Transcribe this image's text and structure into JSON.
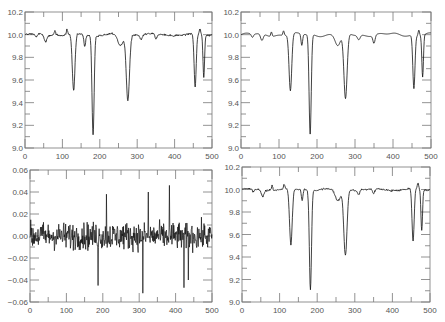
{
  "chart_data": [
    {
      "type": "line",
      "panel": "top-left",
      "title": "",
      "xlabel": "",
      "ylabel": "",
      "xlim": [
        0,
        500
      ],
      "ylim": [
        9.0,
        10.2
      ],
      "xticks": [
        "0",
        "100",
        "200",
        "300",
        "400",
        "500"
      ],
      "yticks": [
        "9.0",
        "9.2",
        "9.4",
        "9.6",
        "9.8",
        "10.0",
        "10.2"
      ],
      "style": "noisy",
      "baseline": 10.0,
      "dips": [
        {
          "x": 30,
          "depth": 0.03,
          "w": 4
        },
        {
          "x": 55,
          "depth": 0.06,
          "w": 5
        },
        {
          "x": 130,
          "depth": 0.5,
          "w": 5
        },
        {
          "x": 160,
          "depth": 0.1,
          "w": 3
        },
        {
          "x": 182,
          "depth": 0.88,
          "w": 4
        },
        {
          "x": 255,
          "depth": 0.1,
          "w": 10
        },
        {
          "x": 275,
          "depth": 0.58,
          "w": 6
        },
        {
          "x": 310,
          "depth": 0.04,
          "w": 5
        },
        {
          "x": 350,
          "depth": 0.05,
          "w": 4
        },
        {
          "x": 455,
          "depth": 0.47,
          "w": 4
        },
        {
          "x": 478,
          "depth": 0.37,
          "w": 3
        }
      ],
      "bumps": [
        {
          "x": 80,
          "h": 0.04
        },
        {
          "x": 112,
          "h": 0.04
        },
        {
          "x": 468,
          "h": 0.05
        }
      ]
    },
    {
      "type": "line",
      "panel": "top-right",
      "title": "",
      "xlabel": "",
      "ylabel": "",
      "xlim": [
        0,
        500
      ],
      "ylim": [
        9.0,
        10.2
      ],
      "xticks": [
        "0",
        "100",
        "200",
        "300",
        "400",
        "500"
      ],
      "yticks": [
        "9.0",
        "9.2",
        "9.4",
        "9.6",
        "9.8",
        "10.0",
        "10.2"
      ],
      "style": "smooth",
      "baseline": 10.0,
      "dips": [
        {
          "x": 30,
          "depth": 0.03,
          "w": 4
        },
        {
          "x": 55,
          "depth": 0.06,
          "w": 5
        },
        {
          "x": 130,
          "depth": 0.5,
          "w": 5
        },
        {
          "x": 160,
          "depth": 0.1,
          "w": 3
        },
        {
          "x": 182,
          "depth": 0.88,
          "w": 4
        },
        {
          "x": 255,
          "depth": 0.1,
          "w": 10
        },
        {
          "x": 275,
          "depth": 0.58,
          "w": 6
        },
        {
          "x": 310,
          "depth": 0.04,
          "w": 5
        },
        {
          "x": 350,
          "depth": 0.07,
          "w": 4
        },
        {
          "x": 455,
          "depth": 0.47,
          "w": 4
        },
        {
          "x": 478,
          "depth": 0.37,
          "w": 3
        }
      ],
      "bumps": [
        {
          "x": 80,
          "h": 0.04
        },
        {
          "x": 112,
          "h": 0.04
        },
        {
          "x": 468,
          "h": 0.05
        }
      ]
    },
    {
      "type": "line",
      "panel": "bottom-left",
      "title": "",
      "xlabel": "",
      "ylabel": "",
      "xlim": [
        0,
        500
      ],
      "ylim": [
        -0.06,
        0.06
      ],
      "xticks": [
        "0",
        "100",
        "200",
        "300",
        "400",
        "500"
      ],
      "yticks": [
        "-0.06",
        "-0.04",
        "-0.02",
        "0.00",
        "0.02",
        "0.04",
        "0.06"
      ],
      "style": "residual",
      "amplitude": 0.015,
      "extremes": [
        {
          "x": 187,
          "y": -0.045
        },
        {
          "x": 210,
          "y": 0.038
        },
        {
          "x": 310,
          "y": -0.052
        },
        {
          "x": 325,
          "y": 0.04
        },
        {
          "x": 383,
          "y": 0.046
        },
        {
          "x": 423,
          "y": -0.047
        },
        {
          "x": 435,
          "y": -0.04
        }
      ]
    },
    {
      "type": "line",
      "panel": "bottom-right",
      "title": "",
      "xlabel": "",
      "ylabel": "",
      "xlim": [
        0,
        500
      ],
      "ylim": [
        9.0,
        10.2
      ],
      "xticks": [
        "0",
        "100",
        "200",
        "300",
        "400",
        "500"
      ],
      "yticks": [
        "9.0",
        "9.2",
        "9.4",
        "9.6",
        "9.8",
        "10.0",
        "10.2"
      ],
      "style": "noisy",
      "baseline": 10.0,
      "dips": [
        {
          "x": 30,
          "depth": 0.03,
          "w": 4
        },
        {
          "x": 55,
          "depth": 0.06,
          "w": 5
        },
        {
          "x": 130,
          "depth": 0.5,
          "w": 5
        },
        {
          "x": 160,
          "depth": 0.1,
          "w": 3
        },
        {
          "x": 182,
          "depth": 0.88,
          "w": 4
        },
        {
          "x": 255,
          "depth": 0.1,
          "w": 10
        },
        {
          "x": 275,
          "depth": 0.58,
          "w": 6
        },
        {
          "x": 310,
          "depth": 0.04,
          "w": 5
        },
        {
          "x": 350,
          "depth": 0.05,
          "w": 4
        },
        {
          "x": 455,
          "depth": 0.47,
          "w": 4
        },
        {
          "x": 478,
          "depth": 0.37,
          "w": 3
        }
      ],
      "bumps": [
        {
          "x": 80,
          "h": 0.04
        },
        {
          "x": 112,
          "h": 0.04
        },
        {
          "x": 468,
          "h": 0.05
        }
      ]
    }
  ],
  "layout": {
    "panels": [
      {
        "left": 25,
        "top": 12,
        "right": 212,
        "bottom": 148
      },
      {
        "left": 241,
        "top": 12,
        "right": 431,
        "bottom": 148
      },
      {
        "left": 30,
        "top": 170,
        "right": 212,
        "bottom": 302
      },
      {
        "left": 242,
        "top": 167,
        "right": 430,
        "bottom": 302
      }
    ],
    "line_color": "#111111",
    "axis_color": "#777777"
  }
}
